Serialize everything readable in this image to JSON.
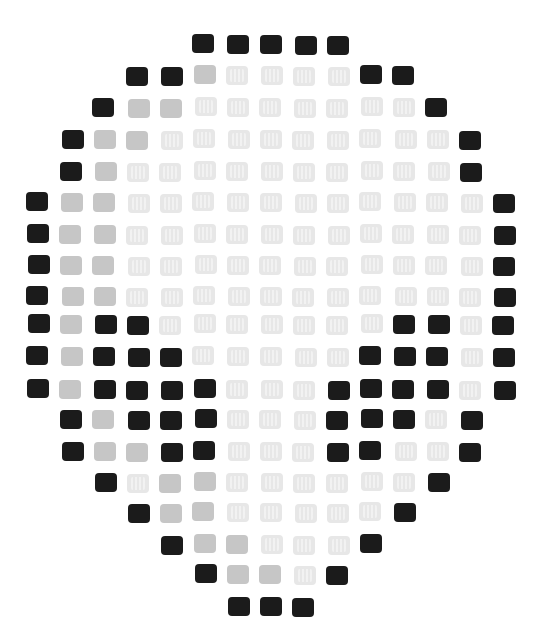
{
  "figure": {
    "legend": {
      "B": "#1b1b1b",
      "G": "#c6c6c6",
      "L": "#e7e7e7"
    },
    "grid": {
      "origin_x": 38,
      "origin_y": 45,
      "col_pitch": 33.3,
      "row_heights": [
        45,
        76,
        108,
        140,
        172,
        203,
        235,
        266,
        297,
        325,
        357,
        390,
        420,
        452,
        483,
        513,
        545,
        575,
        607
      ]
    },
    "rows": [
      {
        "start": 5,
        "cells": "BBBBB"
      },
      {
        "start": 3,
        "cells": "BBGLLLLBB"
      },
      {
        "start": 2,
        "cells": "BGGLLLLLLLB"
      },
      {
        "start": 1,
        "cells": "BGGLLLLLLLLLB"
      },
      {
        "start": 1,
        "cells": "BGLLLLLLLLLLB"
      },
      {
        "start": 0,
        "cells": "BGGLLLLLLLLLLLB"
      },
      {
        "start": 0,
        "cells": "BGGLLLLLLLLLLLB"
      },
      {
        "start": 0,
        "cells": "BGGLLLLLLLLLLLB"
      },
      {
        "start": 0,
        "cells": "BGGLLLLLLLLLLLB"
      },
      {
        "start": 0,
        "cells": "BGBBLLLLLLLBBLB"
      },
      {
        "start": 0,
        "cells": "BGBBBLLLLLBBBLB"
      },
      {
        "start": 0,
        "cells": "BGBBBBLLLBBBBLB"
      },
      {
        "start": 1,
        "cells": "BGBBBLLLBBBLB"
      },
      {
        "start": 1,
        "cells": "BGGBBLLLBBLLB"
      },
      {
        "start": 2,
        "cells": "BLGGLLLLLLB"
      },
      {
        "start": 3,
        "cells": "BGGLLLLLB"
      },
      {
        "start": 4,
        "cells": "BGGLLLB"
      },
      {
        "start": 5,
        "cells": "BGGLB"
      },
      {
        "start": 6,
        "cells": "BBB"
      }
    ]
  }
}
